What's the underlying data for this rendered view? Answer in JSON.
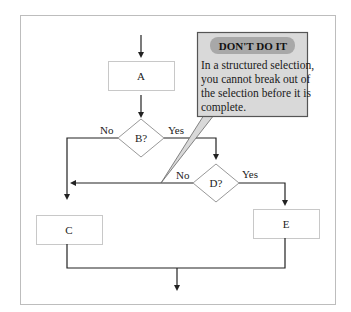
{
  "diagram": {
    "type": "flowchart",
    "nodes": [
      {
        "id": "A",
        "shape": "process",
        "label": "A"
      },
      {
        "id": "B",
        "shape": "decision",
        "label": "B?"
      },
      {
        "id": "C",
        "shape": "process",
        "label": "C"
      },
      {
        "id": "D",
        "shape": "decision",
        "label": "D?"
      },
      {
        "id": "E",
        "shape": "process",
        "label": "E"
      }
    ],
    "edges": [
      {
        "from": "start",
        "to": "A"
      },
      {
        "from": "A",
        "to": "B"
      },
      {
        "from": "B",
        "to": "C",
        "label": "No"
      },
      {
        "from": "B",
        "to": "D",
        "label": "Yes"
      },
      {
        "from": "D",
        "to": "C",
        "label": "No"
      },
      {
        "from": "D",
        "to": "E",
        "label": "Yes"
      },
      {
        "from": "C",
        "to": "end"
      },
      {
        "from": "E",
        "to": "end"
      }
    ],
    "labels": {
      "a": "A",
      "b": "B?",
      "c": "C",
      "d": "D?",
      "e": "E",
      "b_no": "No",
      "b_yes": "Yes",
      "d_no": "No",
      "d_yes": "Yes"
    },
    "callout": {
      "heading": "DON'T DO IT",
      "lines": [
        "In a structured selection,",
        "you cannot break out of",
        "the selection before it is",
        "complete."
      ]
    },
    "colors": {
      "frame_border": "#bdbdbd",
      "line": "#333333",
      "box_border": "#c8c8c8",
      "callout_bg": "#d9d9d9",
      "callout_border": "#555555",
      "heading_pill": "#a8a8a8"
    }
  }
}
